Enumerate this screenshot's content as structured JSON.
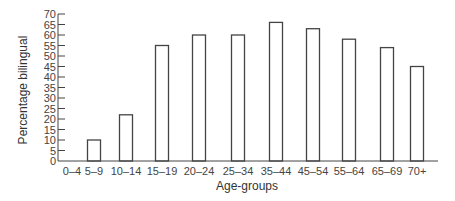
{
  "chart_data": {
    "type": "bar",
    "title": "",
    "xlabel": "Age-groups",
    "ylabel": "Percentage bilingual",
    "categories": [
      "0-4",
      "5-9",
      "10-14",
      "15-19",
      "20-24",
      "25-34",
      "35-44",
      "45-54",
      "55-64",
      "65-69",
      "70+"
    ],
    "values": [
      0,
      10,
      22,
      55,
      60,
      60,
      66,
      63,
      58,
      54,
      45
    ],
    "ylim": [
      0,
      70
    ],
    "yticks": [
      0,
      5,
      10,
      15,
      20,
      25,
      30,
      35,
      40,
      45,
      50,
      55,
      60,
      65,
      70
    ],
    "grid": false,
    "legend": null,
    "bar_style": {
      "fill": "#ffffff",
      "stroke": "#444444"
    }
  },
  "labels": {
    "xlabel": "Age-groups",
    "ylabel": "Percentage bilingual"
  }
}
